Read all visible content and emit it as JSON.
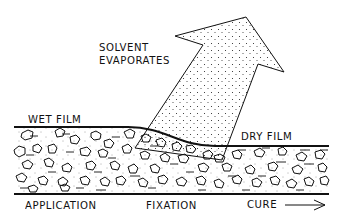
{
  "diagram": {
    "labels": {
      "solvent_line1": "SOLVENT",
      "solvent_line2": "EVAPORATES",
      "wet_film": "WET FILM",
      "dry_film": "DRY FILM",
      "stage_application": "APPLICATION",
      "stage_fixation": "FIXATION",
      "stage_cure": "CURE"
    },
    "colors": {
      "line": "#111111",
      "background": "#ffffff"
    },
    "stages": [
      "APPLICATION",
      "FIXATION",
      "CURE"
    ]
  }
}
